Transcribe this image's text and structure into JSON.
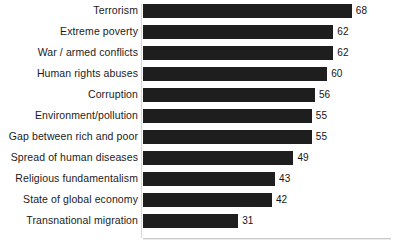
{
  "chart_data": {
    "type": "bar",
    "orientation": "horizontal",
    "title": "",
    "subtitle": "",
    "xlabel": "",
    "ylabel": "",
    "xlim": [
      0,
      68
    ],
    "grid": false,
    "legend": null,
    "data_labels": true,
    "bar_color": "#1e1e1e",
    "background_color": "#ffffff",
    "categories": [
      "Terrorism",
      "Extreme poverty",
      "War / armed conflicts",
      "Human rights abuses",
      "Corruption",
      "Environment/pollution",
      "Gap between rich and poor",
      "Spread of human diseases",
      "Religious fundamentalism",
      "State of global economy",
      "Transnational migration"
    ],
    "values": [
      68,
      62,
      62,
      60,
      56,
      55,
      55,
      49,
      43,
      42,
      31
    ],
    "value_labels": [
      "68",
      "62",
      "62",
      "60",
      "56",
      "55",
      "55",
      "49",
      "43",
      "42",
      "31"
    ],
    "series": [
      {
        "name": "",
        "values": [
          68,
          62,
          62,
          60,
          56,
          55,
          55,
          49,
          43,
          42,
          31
        ]
      }
    ]
  },
  "axis": {
    "max_value": 68,
    "pixels_per_unit": 3.07
  }
}
